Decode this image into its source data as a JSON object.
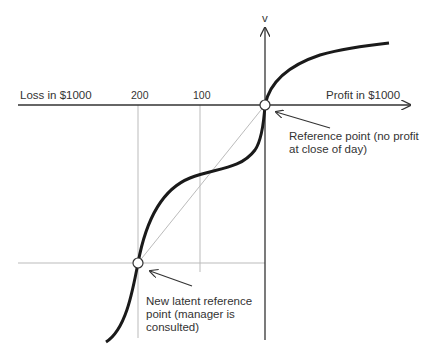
{
  "diagram": {
    "axis_y_label": "v",
    "axis_left_label": "Loss in $1000",
    "axis_right_label": "Profit in $1000",
    "ticks": [
      "200",
      "100"
    ],
    "annotations": {
      "reference_point": [
        "Reference point (no profit",
        "at close of day)"
      ],
      "latent_point": [
        "New latent reference",
        "point (manager is",
        "consulted)"
      ]
    },
    "colors": {
      "curve": "#1a1a1a",
      "axis": "#333333",
      "guide": "#b8b8b8"
    }
  }
}
